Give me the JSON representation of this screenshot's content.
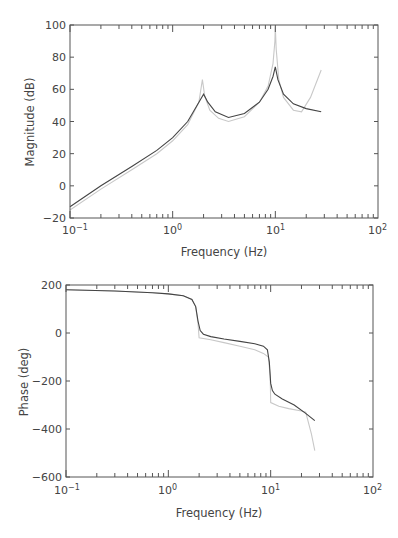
{
  "chart_data": [
    {
      "type": "line",
      "title": "",
      "xlabel": "Frequency (Hz)",
      "ylabel": "Magnitude (dB)",
      "xscale": "log",
      "xlim": [
        0.1,
        100
      ],
      "ylim": [
        -20,
        100
      ],
      "xticks": [
        "10-1",
        "100",
        "101",
        "102"
      ],
      "yticks": [
        -20,
        0,
        20,
        40,
        60,
        80,
        100
      ],
      "grid": false,
      "legend": null,
      "series": [
        {
          "name": "dark",
          "color": "#444444",
          "x": [
            0.1,
            0.2,
            0.4,
            0.7,
            1.0,
            1.4,
            1.8,
            2.0,
            2.2,
            2.6,
            3.5,
            5.0,
            7.0,
            8.5,
            9.5,
            10.0,
            10.6,
            12,
            15,
            20,
            28
          ],
          "y": [
            -13,
            0,
            12,
            22,
            30,
            40,
            52,
            57,
            52,
            46,
            42.5,
            45,
            52,
            60,
            68,
            74,
            66,
            57,
            51,
            48,
            46
          ]
        },
        {
          "name": "light",
          "color": "#c8c8c8",
          "x": [
            0.1,
            0.2,
            0.4,
            0.7,
            1.0,
            1.4,
            1.8,
            1.95,
            2.05,
            2.3,
            2.8,
            3.5,
            5.0,
            7.0,
            8.5,
            9.5,
            9.9,
            10.0,
            10.2,
            10.8,
            12,
            15,
            18,
            22,
            28
          ],
          "y": [
            -15,
            -2,
            10,
            20,
            28,
            38,
            52,
            66,
            56,
            47,
            42,
            40,
            43,
            52,
            62,
            76,
            90,
            99,
            85,
            66,
            55,
            47,
            46,
            55,
            72
          ]
        }
      ]
    },
    {
      "type": "line",
      "title": "",
      "xlabel": "Frequency (Hz)",
      "ylabel": "Phase (deg)",
      "xscale": "log",
      "xlim": [
        0.1,
        100
      ],
      "ylim": [
        -600,
        200
      ],
      "xticks": [
        "10-1",
        "100",
        "101",
        "102"
      ],
      "yticks": [
        -600,
        -400,
        -200,
        0,
        200
      ],
      "grid": false,
      "legend": null,
      "series": [
        {
          "name": "dark",
          "color": "#444444",
          "x": [
            0.1,
            0.3,
            0.7,
            1.0,
            1.4,
            1.7,
            1.85,
            1.95,
            2.05,
            2.2,
            2.6,
            3.5,
            5.0,
            7.0,
            8.5,
            9.3,
            9.7,
            10.0,
            10.4,
            11,
            13,
            17,
            22,
            27
          ],
          "y": [
            180,
            175,
            168,
            163,
            155,
            140,
            110,
            50,
            10,
            -5,
            -15,
            -25,
            -35,
            -45,
            -55,
            -70,
            -120,
            -210,
            -240,
            -255,
            -275,
            -300,
            -335,
            -365
          ]
        },
        {
          "name": "light",
          "color": "#c8c8c8",
          "x": [
            0.1,
            0.3,
            0.7,
            1.0,
            1.4,
            1.7,
            1.85,
            1.95,
            2.0,
            2.6,
            3.5,
            5.0,
            7.0,
            8.5,
            9.5,
            9.9,
            10.0,
            12,
            15,
            20,
            22,
            25,
            27
          ],
          "y": [
            180,
            175,
            168,
            163,
            155,
            140,
            110,
            40,
            -20,
            -28,
            -40,
            -55,
            -70,
            -85,
            -100,
            -180,
            -290,
            -305,
            -315,
            -325,
            -330,
            -420,
            -490
          ]
        }
      ]
    }
  ],
  "top_plot": {
    "ylabel": "Magnitude (dB)",
    "xlabel": "Frequency (Hz)",
    "yticks": [
      "100",
      "80",
      "60",
      "40",
      "20",
      "0",
      "−20"
    ],
    "xtick_base": "10",
    "xtick_exps": [
      "−1",
      "0",
      "1",
      "2"
    ]
  },
  "bottom_plot": {
    "ylabel": "Phase (deg)",
    "xlabel": "Frequency (Hz)",
    "yticks": [
      "200",
      "0",
      "−200",
      "−400",
      "−600"
    ],
    "xtick_base": "10",
    "xtick_exps": [
      "−1",
      "0",
      "1",
      "2"
    ]
  }
}
